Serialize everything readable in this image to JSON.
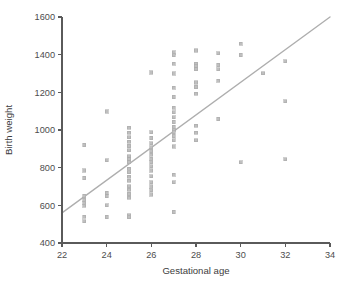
{
  "chart_data": {
    "type": "scatter",
    "title": "",
    "subtitle": "",
    "xlabel": "Gestational age",
    "ylabel": "Birth weight",
    "xlim": [
      22,
      34
    ],
    "ylim": [
      400,
      1600
    ],
    "xticks": [
      22,
      24,
      26,
      28,
      30,
      32,
      34
    ],
    "yticks": [
      400,
      600,
      800,
      1000,
      1200,
      1400,
      1600
    ],
    "xtick_labels": [
      "22",
      "24",
      "26",
      "28",
      "30",
      "32",
      "34"
    ],
    "ytick_labels": [
      "400",
      "600",
      "800",
      "1000",
      "1200",
      "1400",
      "1600"
    ],
    "grid": false,
    "legend": null,
    "marker_style": "square",
    "marker_color": "#bfbfbf",
    "line_color": "#aeaeae",
    "axis_color": "#5a5a5a",
    "background_color": "#ffffff",
    "annotations": [],
    "trend_line": {
      "type": "linear-fit",
      "x_start": 22,
      "y_start": 560,
      "x_end": 34,
      "y_end": 1600,
      "slope": 86.7,
      "intercept": -1347
    },
    "points": [
      [
        23,
        920
      ],
      [
        23,
        785
      ],
      [
        23,
        745
      ],
      [
        23,
        650
      ],
      [
        23,
        630
      ],
      [
        23,
        612
      ],
      [
        23,
        598
      ],
      [
        23,
        540
      ],
      [
        23,
        515
      ],
      [
        24,
        1098
      ],
      [
        24,
        840
      ],
      [
        24,
        665
      ],
      [
        24,
        648
      ],
      [
        24,
        600
      ],
      [
        24,
        538
      ],
      [
        25,
        1012
      ],
      [
        25,
        985
      ],
      [
        25,
        962
      ],
      [
        25,
        938
      ],
      [
        25,
        915
      ],
      [
        25,
        892
      ],
      [
        25,
        860
      ],
      [
        25,
        845
      ],
      [
        25,
        828
      ],
      [
        25,
        795
      ],
      [
        25,
        775
      ],
      [
        25,
        752
      ],
      [
        25,
        730
      ],
      [
        25,
        702
      ],
      [
        25,
        682
      ],
      [
        25,
        660
      ],
      [
        25,
        640
      ],
      [
        25,
        548
      ],
      [
        25,
        538
      ],
      [
        26,
        1305
      ],
      [
        26,
        988
      ],
      [
        26,
        958
      ],
      [
        26,
        930
      ],
      [
        26,
        908
      ],
      [
        26,
        888
      ],
      [
        26,
        868
      ],
      [
        26,
        848
      ],
      [
        26,
        830
      ],
      [
        26,
        808
      ],
      [
        26,
        785
      ],
      [
        26,
        755
      ],
      [
        26,
        722
      ],
      [
        26,
        700
      ],
      [
        26,
        680
      ],
      [
        26,
        658
      ],
      [
        27,
        1412
      ],
      [
        27,
        1398
      ],
      [
        27,
        1352
      ],
      [
        27,
        1300
      ],
      [
        27,
        1225
      ],
      [
        27,
        1175
      ],
      [
        27,
        1118
      ],
      [
        27,
        1095
      ],
      [
        27,
        1068
      ],
      [
        27,
        1042
      ],
      [
        27,
        1018
      ],
      [
        27,
        1002
      ],
      [
        27,
        988
      ],
      [
        27,
        968
      ],
      [
        27,
        945
      ],
      [
        27,
        912
      ],
      [
        27,
        762
      ],
      [
        27,
        722
      ],
      [
        27,
        565
      ],
      [
        28,
        1422
      ],
      [
        28,
        1352
      ],
      [
        28,
        1338
      ],
      [
        28,
        1322
      ],
      [
        28,
        1252
      ],
      [
        28,
        1228
      ],
      [
        28,
        1192
      ],
      [
        28,
        1022
      ],
      [
        28,
        985
      ],
      [
        28,
        945
      ],
      [
        29,
        1408
      ],
      [
        29,
        1345
      ],
      [
        29,
        1322
      ],
      [
        29,
        1262
      ],
      [
        29,
        1058
      ],
      [
        30,
        1458
      ],
      [
        30,
        1398
      ],
      [
        30,
        828
      ],
      [
        31,
        1302
      ],
      [
        32,
        1365
      ],
      [
        32,
        1152
      ],
      [
        32,
        845
      ]
    ]
  },
  "axis": {
    "x_title": "Gestational age",
    "y_title": "Birth weight"
  }
}
